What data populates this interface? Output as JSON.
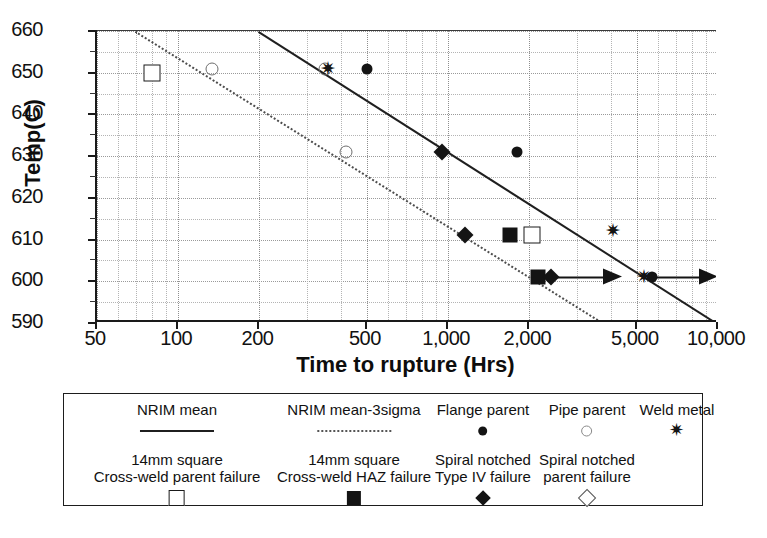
{
  "chart_data": {
    "type": "scatter",
    "title": "",
    "xlabel": "Time to rupture (Hrs)",
    "ylabel": "Temp(C)",
    "xscale": "log",
    "xlim": [
      50,
      10000
    ],
    "ylim": [
      590,
      660
    ],
    "xticks": [
      "50",
      "100",
      "200",
      "500",
      "1,000",
      "2,000",
      "5,000",
      "10,000"
    ],
    "xtick_values": [
      50,
      100,
      200,
      500,
      1000,
      2000,
      5000,
      10000
    ],
    "yticks": [
      "590",
      "600",
      "610",
      "620",
      "630",
      "640",
      "650",
      "660"
    ],
    "ytick_values": [
      590,
      600,
      610,
      620,
      630,
      640,
      650,
      660
    ],
    "grid": true,
    "legend_position": "below",
    "series": [
      {
        "name": "Flange parent",
        "marker": "filled-circle",
        "points": [
          {
            "x": 500,
            "y": 651
          },
          {
            "x": 1800,
            "y": 631
          },
          {
            "x": 5700,
            "y": 601
          }
        ]
      },
      {
        "name": "Pipe parent",
        "marker": "open-circle",
        "points": [
          {
            "x": 133,
            "y": 651
          },
          {
            "x": 350,
            "y": 651
          },
          {
            "x": 420,
            "y": 631
          }
        ]
      },
      {
        "name": "Weld metal",
        "marker": "star",
        "points": [
          {
            "x": 360,
            "y": 651
          },
          {
            "x": 4100,
            "y": 612
          },
          {
            "x": 5300,
            "y": 601
          }
        ]
      },
      {
        "name": "14mm square Cross-weld parent failure",
        "marker": "open-square",
        "points": [
          {
            "x": 80,
            "y": 650
          },
          {
            "x": 2050,
            "y": 611
          }
        ]
      },
      {
        "name": "14mm square Cross-weld HAZ failure",
        "marker": "filled-square",
        "points": [
          {
            "x": 1700,
            "y": 611
          },
          {
            "x": 2150,
            "y": 601
          }
        ]
      },
      {
        "name": "Spiral notched Type IV failure",
        "marker": "filled-diamond",
        "points": [
          {
            "x": 950,
            "y": 631
          },
          {
            "x": 1150,
            "y": 611
          },
          {
            "x": 2400,
            "y": 601
          }
        ]
      },
      {
        "name": "Spiral notched parent failure",
        "marker": "open-diamond",
        "points": []
      }
    ],
    "runout_arrows": [
      {
        "x_start": 2500,
        "x_end": 4400,
        "y": 601
      },
      {
        "x_start": 5900,
        "x_end": 10000,
        "y": 601
      }
    ],
    "trend_lines": [
      {
        "name": "NRIM mean",
        "style": "solid",
        "points": [
          {
            "x": 200,
            "y": 660
          },
          {
            "x": 10000,
            "y": 590
          }
        ]
      },
      {
        "name": "NRIM mean-3sigma",
        "style": "dotted",
        "points": [
          {
            "x": 70,
            "y": 660
          },
          {
            "x": 3800,
            "y": 590
          }
        ]
      }
    ]
  },
  "legend": {
    "row1": [
      {
        "label_lines": [
          "NRIM mean"
        ],
        "symbol": "line"
      },
      {
        "label_lines": [
          "NRIM mean-3sigma"
        ],
        "symbol": "dotted-line"
      },
      {
        "label_lines": [
          "Flange parent"
        ],
        "symbol": "filled-circle"
      },
      {
        "label_lines": [
          "Pipe parent"
        ],
        "symbol": "open-circle"
      },
      {
        "label_lines": [
          "Weld metal"
        ],
        "symbol": "star"
      }
    ],
    "row2": [
      {
        "label_lines": [
          "14mm square",
          "Cross-weld parent failure"
        ],
        "symbol": "open-square"
      },
      {
        "label_lines": [
          "14mm square",
          "Cross-weld HAZ failure"
        ],
        "symbol": "filled-square"
      },
      {
        "label_lines": [
          "Spiral notched",
          "Type IV failure"
        ],
        "symbol": "filled-diamond"
      },
      {
        "label_lines": [
          "Spiral notched",
          "parent failure"
        ],
        "symbol": "open-diamond"
      }
    ]
  },
  "colors": {
    "ink": "#141414",
    "axis": "#1a1a1a",
    "grid": "#b4b4b4",
    "background": "#ffffff"
  }
}
